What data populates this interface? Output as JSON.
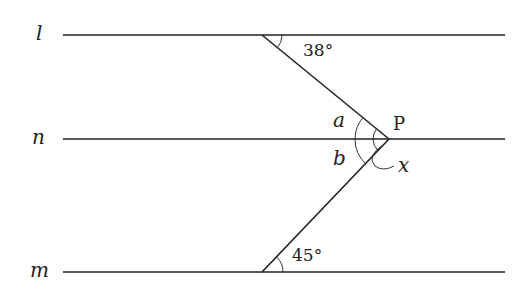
{
  "diagram": {
    "lines": {
      "l": {
        "label": "l",
        "y": 35
      },
      "n": {
        "label": "n",
        "y": 139
      },
      "m": {
        "label": "m",
        "y": 272
      }
    },
    "point": {
      "label": "P"
    },
    "angles": {
      "top": "38°",
      "bottom": "45°",
      "a": "a",
      "b": "b",
      "x": "x"
    },
    "stroke_color": "#222222"
  }
}
